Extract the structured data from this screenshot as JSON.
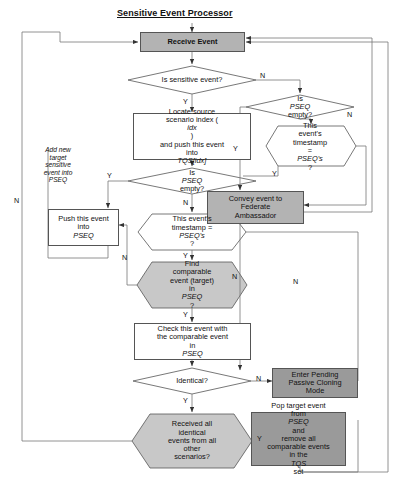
{
  "diagram": {
    "title": "Sensitive Event Processor",
    "colors": {
      "fill_dark": "#9a9a9a",
      "fill_mid": "#b3b3b3",
      "fill_light": "#c8c8c8",
      "fill_white": "#ffffff",
      "stroke": "#555555",
      "text": "#111111"
    },
    "nodes": {
      "receive_event": "Receive Event",
      "is_sensitive_event": "Is sensitive event?",
      "locate_source": "Locate source scenario index ( idx) and push this event into TQS[idx]",
      "is_pseq_empty_left": "Is PSEQ empty?",
      "push_this_event": "Push this event into PSEQ",
      "this_events_timestamp_left": "This event's timestamp = PSEQ's?",
      "find_comparable": "Find comparable event (target) in PSEQ?",
      "check_this_event": "Check this event with the comparable event in PSEQ",
      "identical": "Identical?",
      "received_all_identical": "Received all identical events from all other scenarios?",
      "is_pseq_empty_right": "Is PSEQ empty?",
      "this_events_timestamp_right": "This event's timestamp = PSEQ's?",
      "convey_event": "Convey event to Federate Ambassador",
      "enter_pending": "Enter Pending Passive Cloning Mode",
      "pop_target_event": "Pop target event from PSEQ and remove all comparable events in the TQS set"
    },
    "annotations": {
      "add_new_target": "Add new target sensitive event into PSEQ"
    },
    "edge_labels": {
      "sensitive_no": "N",
      "sensitive_yes": "Y",
      "pseq_left_yes": "Y",
      "pseq_left_no": "N",
      "ts_left_yes": "Y",
      "ts_left_no": "N",
      "find_no": "N",
      "find_yes": "Y",
      "identical_no": "N",
      "identical_yes": "Y",
      "received_yes": "Y",
      "received_no": "N",
      "pseq_right_yes": "Y",
      "pseq_right_no": "N",
      "ts_right_yes": "Y",
      "ts_right_no": "N"
    }
  }
}
